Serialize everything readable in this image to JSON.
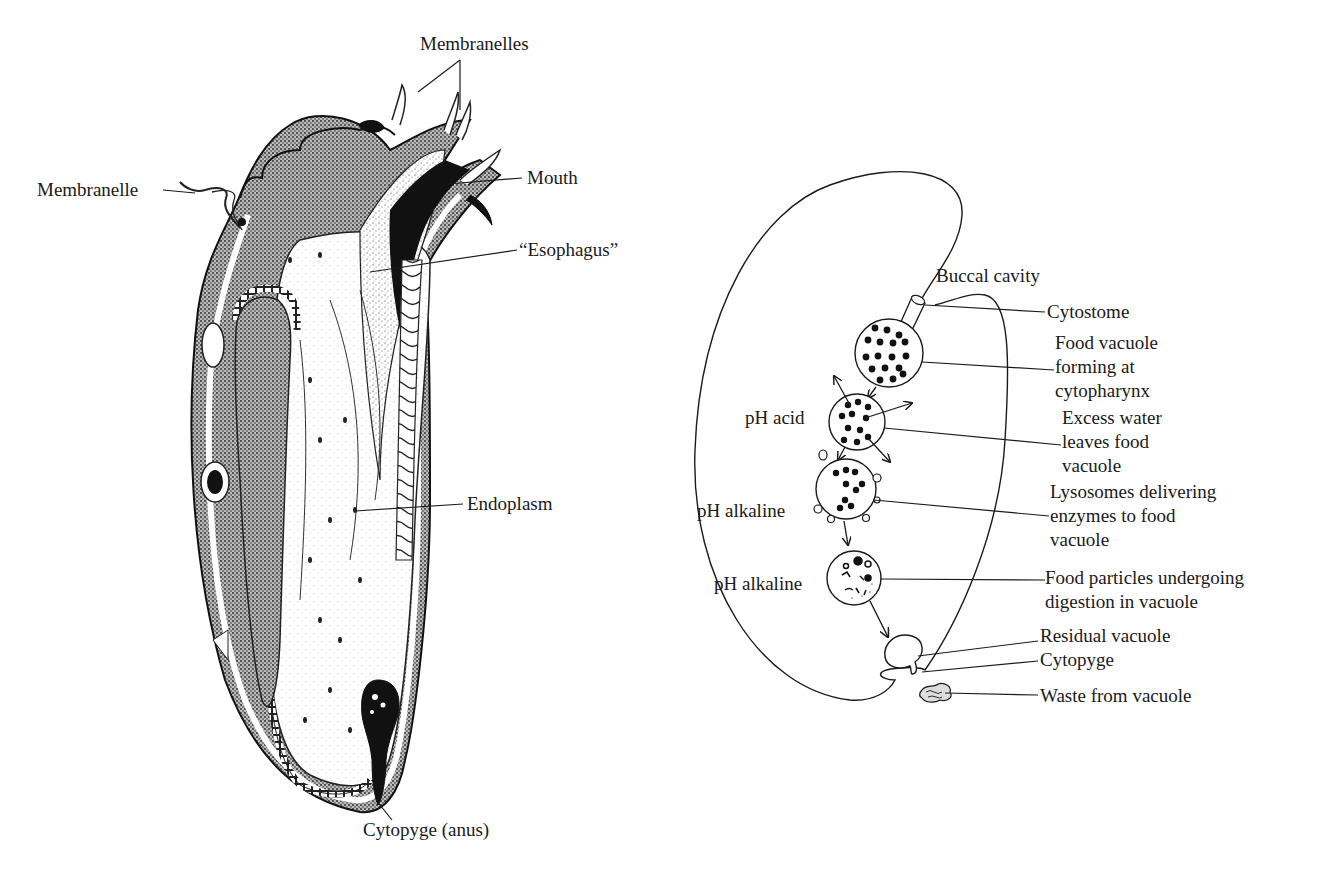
{
  "left_diagram": {
    "subject": "ciliate cross-section",
    "labels": {
      "membranelles": "Membranelles",
      "membranelle": "Membranelle",
      "mouth": "Mouth",
      "esophagus": "“Esophagus”",
      "endoplasm": "Endoplasm",
      "cytopyge_anus": "Cytopyge (anus)"
    }
  },
  "right_diagram": {
    "subject": "food vacuole digestion pathway",
    "labels": {
      "buccal_cavity": "Buccal cavity",
      "cytostome": "Cytostome",
      "food_vacuole_forming": [
        "Food vacuole",
        "forming at",
        "cytopharynx"
      ],
      "ph_acid": "pH acid",
      "excess_water": [
        "Excess water",
        "leaves food",
        "vacuole"
      ],
      "ph_alkaline_1": "pH alkaline",
      "lysosomes": [
        "Lysosomes delivering",
        "enzymes to food",
        "vacuole"
      ],
      "ph_alkaline_2": "pH alkaline",
      "food_particles": [
        "Food particles undergoing",
        "digestion in vacuole"
      ],
      "residual_vacuole": "Residual vacuole",
      "cytopyge": "Cytopyge",
      "waste": "Waste from vacuole"
    }
  }
}
